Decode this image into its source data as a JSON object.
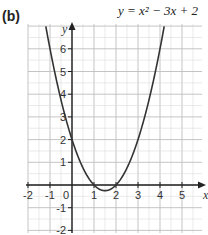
{
  "panel_label": "(b)",
  "equation": "y = x² − 3x + 2",
  "chart_data": {
    "type": "line",
    "title": "y = x² − 3x + 2",
    "xlabel": "x",
    "ylabel": "y",
    "xlim": [
      -2.0,
      6.0
    ],
    "ylim": [
      -2.0,
      6.8
    ],
    "x_ticks": [
      -2,
      -1,
      0,
      1,
      2,
      3,
      4,
      5
    ],
    "y_ticks": [
      -2,
      -1,
      1,
      2,
      3,
      4,
      5,
      6
    ],
    "grid": true,
    "minor_grid_step": 0.5,
    "series": [
      {
        "name": "y = x² − 3x + 2",
        "x": [
          -1.2,
          -1.0,
          -0.5,
          0,
          0.5,
          1.0,
          1.5,
          2.0,
          2.5,
          3.0,
          3.5,
          4.0,
          4.2
        ],
        "y": [
          7.04,
          6.0,
          3.75,
          2.0,
          0.75,
          0.0,
          -0.25,
          0.0,
          0.75,
          2.0,
          3.75,
          6.0,
          7.04
        ]
      }
    ],
    "color": "#333333"
  },
  "ticks": {
    "x": [
      "-2",
      "-1",
      "0",
      "1",
      "2",
      "3",
      "4",
      "5"
    ],
    "y": [
      "6",
      "5",
      "4",
      "3",
      "2",
      "1",
      "-1",
      "-2"
    ]
  }
}
